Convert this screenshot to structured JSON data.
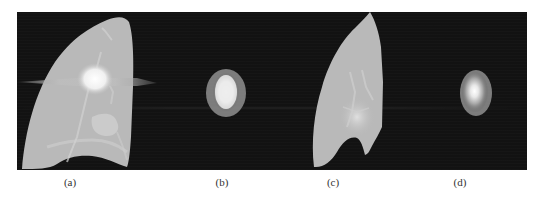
{
  "figure": {
    "panels": [
      {
        "id": "a",
        "label": "(a)",
        "content": "lung-ct-slice-with-nodule",
        "label_x": 70
      },
      {
        "id": "b",
        "label": "(b)",
        "content": "nodule-segmentation-crop",
        "label_x": 222
      },
      {
        "id": "c",
        "label": "(c)",
        "content": "lung-ct-slice",
        "label_x": 333
      },
      {
        "id": "d",
        "label": "(d)",
        "content": "nodule-segmentation-crop",
        "label_x": 460
      }
    ]
  },
  "colors": {
    "background": "#ffffff",
    "scan_background": "#121212",
    "lung_tissue": "#b9b9b9",
    "nodule_outer": "#9a9a9a",
    "nodule_core": "#f2f2f2",
    "caption_text": "#333333"
  }
}
